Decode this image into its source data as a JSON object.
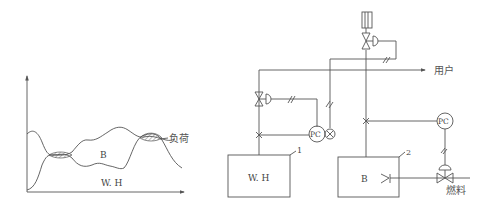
{
  "left_chart": {
    "series": [
      {
        "name": "负荷",
        "label": "负荷"
      },
      {
        "name": "W.H capacity curve"
      }
    ],
    "region_labels": {
      "upper": "B",
      "lower": "W. H"
    },
    "axes": {
      "x_arrow": true,
      "y_arrow": true,
      "tick_labels": false
    }
  },
  "right_diagram": {
    "boxes": [
      {
        "id": "1",
        "label": "W. H",
        "number": "1"
      },
      {
        "id": "2",
        "label": "B",
        "number": "2"
      }
    ],
    "controllers": [
      {
        "label": "PC",
        "position": "left"
      },
      {
        "label": "PC",
        "position": "right"
      }
    ],
    "outputs": {
      "user": "用户",
      "fuel": "燃料"
    }
  }
}
